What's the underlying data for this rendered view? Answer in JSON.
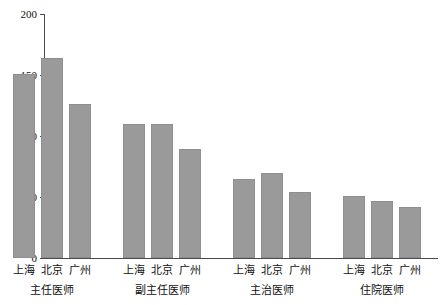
{
  "chart_data": {
    "type": "bar",
    "title": "",
    "subtitle": "",
    "xlabel": "",
    "ylabel": "电话咨询价格（元）",
    "ylim": [
      0,
      200
    ],
    "ytick_values": [
      0,
      50,
      100,
      150,
      200
    ],
    "ytick_labels": [
      "0",
      "50",
      "100",
      "150",
      "200"
    ],
    "grid": false,
    "legend": null,
    "categories": [
      "上海",
      "北京",
      "广州"
    ],
    "groups": [
      {
        "label": "主任医师",
        "bars": [
          {
            "category": "上海",
            "value": 151
          },
          {
            "category": "北京",
            "value": 164
          },
          {
            "category": "广州",
            "value": 126
          }
        ]
      },
      {
        "label": "副主任医师",
        "bars": [
          {
            "category": "上海",
            "value": 110
          },
          {
            "category": "北京",
            "value": 110
          },
          {
            "category": "广州",
            "value": 89
          }
        ]
      },
      {
        "label": "主治医师",
        "bars": [
          {
            "category": "上海",
            "value": 65
          },
          {
            "category": "北京",
            "value": 70
          },
          {
            "category": "广州",
            "value": 54
          }
        ]
      },
      {
        "label": "住院医师",
        "bars": [
          {
            "category": "上海",
            "value": 51
          },
          {
            "category": "北京",
            "value": 47
          },
          {
            "category": "广州",
            "value": 42
          }
        ]
      }
    ],
    "colors": {
      "bar_fill": "#9a9a9a",
      "bar_stroke": "#8e8e8e",
      "axis": "#4a4a4a",
      "text": "#111111",
      "background": "#ffffff"
    }
  }
}
